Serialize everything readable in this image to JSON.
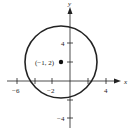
{
  "diagram": {
    "type": "circle-graph",
    "axes": {
      "x_label": "x",
      "y_label": "y",
      "x_ticks": [
        -6,
        -4,
        -2,
        2,
        4
      ],
      "x_tick_labels": [
        "-6",
        "-2",
        "4"
      ],
      "y_ticks": [
        4,
        2,
        -2,
        -4
      ],
      "y_tick_labels": [
        "4",
        "-4"
      ]
    },
    "circle": {
      "center": [
        -1,
        2
      ],
      "center_label": "(−1, 2)",
      "radius": 4
    },
    "colors": {
      "stroke": "#222222",
      "background": "#ffffff"
    }
  },
  "labels": {
    "x_axis": "x",
    "y_axis": "y",
    "xt_m6": "−6",
    "xt_m2": "−2",
    "xt_4": "4",
    "yt_4": "4",
    "yt_m4": "−4",
    "center": "(−1, 2)"
  }
}
